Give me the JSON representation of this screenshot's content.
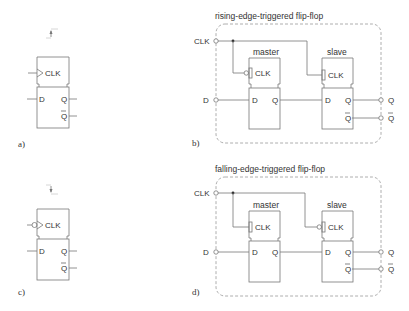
{
  "panels": {
    "a": {
      "label": "a)",
      "clock_pin": "CLK",
      "inputs": [
        "D"
      ],
      "outputs": [
        "Q",
        "Q"
      ],
      "edge_marker": "rising-arrow"
    },
    "b": {
      "label": "b)",
      "title": "rising-edge-triggered flip-flop",
      "external_inputs": [
        "CLK",
        "D"
      ],
      "external_outputs": [
        "Q",
        "Q"
      ],
      "master": {
        "name": "master",
        "clock_pin": "CLK",
        "in": "D",
        "out": "Q",
        "clock_inverted": true
      },
      "slave": {
        "name": "slave",
        "clock_pin": "CLK",
        "in": "D",
        "out": "Q",
        "out_bar": "Q",
        "clock_inverted": false
      }
    },
    "c": {
      "label": "c)",
      "clock_pin": "CLK",
      "inputs": [
        "D"
      ],
      "outputs": [
        "Q",
        "Q"
      ],
      "edge_marker": "falling-arrow"
    },
    "d": {
      "label": "d)",
      "title": "falling-edge-triggered flip-flop",
      "external_inputs": [
        "CLK",
        "D"
      ],
      "external_outputs": [
        "Q",
        "Q"
      ],
      "master": {
        "name": "master",
        "clock_pin": "CLK",
        "in": "D",
        "out": "Q",
        "clock_inverted": false
      },
      "slave": {
        "name": "slave",
        "clock_pin": "CLK",
        "in": "D",
        "out": "Q",
        "out_bar": "Q",
        "clock_inverted": true
      }
    }
  },
  "colors": {
    "line": "#777777",
    "text": "#333333",
    "dash": "#999999"
  }
}
